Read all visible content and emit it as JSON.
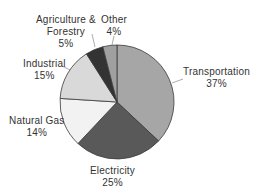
{
  "chart_data": {
    "type": "pie",
    "title": "",
    "categories": [
      "Transportation",
      "Electricity",
      "Natural Gas",
      "Industrial",
      "Agriculture & Forestry",
      "Other"
    ],
    "values": [
      37,
      25,
      14,
      15,
      5,
      4
    ],
    "unit": "%",
    "colors": [
      "#a6a6a6",
      "#595959",
      "#f2f2f2",
      "#d9d9d9",
      "#333333",
      "#a0a0a0"
    ],
    "start_angle": "12 o'clock",
    "direction": "clockwise",
    "legend": "none (labels with leader lines)"
  },
  "labels": {
    "transportation": {
      "name": "Transportation",
      "pct": "37%"
    },
    "electricity": {
      "name": "Electricity",
      "pct": "25%"
    },
    "natural_gas": {
      "name": "Natural Gas",
      "pct": "14%"
    },
    "industrial": {
      "name": "Industrial",
      "pct": "15%"
    },
    "agriculture": {
      "name1": "Agriculture &",
      "name2": "Forestry",
      "pct": "5%"
    },
    "other": {
      "name": "Other",
      "pct": "4%"
    }
  }
}
